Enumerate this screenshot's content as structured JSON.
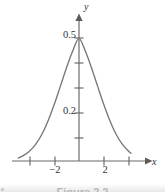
{
  "figure": {
    "axis_labels": {
      "x": "x",
      "y": "y"
    },
    "y_tick_labels": {
      "t05": "0.5",
      "t02": "0.2"
    },
    "x_tick_labels": {
      "neg2": "−2",
      "pos2": "2"
    },
    "caption": "Figure 2.2",
    "colors": {
      "curve": "#7b7672",
      "axis": "#6f6b67",
      "text": "#35332f",
      "background": "#ffffff",
      "caption_bar": "#ededed"
    }
  },
  "chart_data": {
    "type": "line",
    "title": "",
    "xlabel": "x",
    "ylabel": "y",
    "xlim": [
      -4.9,
      4.2
    ],
    "ylim": [
      0,
      0.62
    ],
    "grid": false,
    "legend": null,
    "x_ticks": [
      -4,
      -2,
      2,
      4
    ],
    "x_tick_labels": [
      "",
      "−2",
      "2",
      ""
    ],
    "y_ticks": [
      0.1,
      0.2,
      0.3,
      0.4,
      0.5
    ],
    "y_tick_labels": [
      "",
      "0.2",
      "",
      "",
      "0.5"
    ],
    "series": [
      {
        "name": "bell curve",
        "description": "Gaussian-shaped bell curve peaking at x = 0 with height 0.5, decaying symmetrically toward zero at the plot edges",
        "x": [
          -4.9,
          -4.5,
          -4.0,
          -3.5,
          -3.0,
          -2.5,
          -2.0,
          -1.5,
          -1.0,
          -0.5,
          0.0,
          0.5,
          1.0,
          1.5,
          2.0,
          2.5,
          3.0,
          3.5,
          4.0,
          4.2
        ],
        "y": [
          0.012,
          0.022,
          0.04,
          0.068,
          0.108,
          0.163,
          0.23,
          0.305,
          0.381,
          0.449,
          0.5,
          0.449,
          0.381,
          0.305,
          0.23,
          0.163,
          0.108,
          0.068,
          0.04,
          0.031
        ]
      }
    ]
  }
}
